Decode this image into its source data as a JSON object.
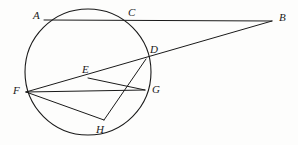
{
  "figure": {
    "kind": "euclidean-circle-diagram",
    "width": 298,
    "height": 145,
    "background_color": "#fdfdfc",
    "stroke_color": "#1a1a1a",
    "label_color": "#1a1a1a"
  },
  "circle": {
    "name": "main-circle",
    "cx": 88,
    "cy": 72,
    "r": 63,
    "stroke_width": 1.1
  },
  "points": [
    {
      "id": "A",
      "label": "A",
      "x": 44,
      "y": 20,
      "label_x": 33,
      "label_y": 10,
      "on_circle": true
    },
    {
      "id": "B",
      "label": "B",
      "x": 272,
      "y": 21,
      "label_x": 279,
      "label_y": 12,
      "on_circle": false
    },
    {
      "id": "C",
      "label": "C",
      "x": 127,
      "y": 20,
      "label_x": 128,
      "label_y": 7,
      "on_circle": true
    },
    {
      "id": "D",
      "label": "D",
      "x": 146,
      "y": 59,
      "label_x": 150,
      "label_y": 44,
      "on_circle": true
    },
    {
      "id": "E",
      "label": "E",
      "x": 88,
      "y": 78,
      "label_x": 82,
      "label_y": 64,
      "on_circle": false
    },
    {
      "id": "F",
      "label": "F",
      "x": 26,
      "y": 92,
      "label_x": 13,
      "label_y": 85,
      "on_circle": true
    },
    {
      "id": "G",
      "label": "G",
      "x": 145,
      "y": 90,
      "label_x": 152,
      "label_y": 84,
      "on_circle": true
    },
    {
      "id": "H",
      "label": "H",
      "x": 104,
      "y": 120,
      "label_x": 96,
      "label_y": 124,
      "on_circle": true
    }
  ],
  "segments": [
    {
      "name": "segment-A-B",
      "from": "A",
      "to": "B",
      "x1": 44,
      "y1": 20,
      "x2": 272,
      "y2": 21
    },
    {
      "name": "segment-F-B",
      "from": "F",
      "to": "B",
      "x1": 26,
      "y1": 92,
      "x2": 272,
      "y2": 21
    },
    {
      "name": "segment-F-G",
      "from": "F",
      "to": "G",
      "x1": 26,
      "y1": 92,
      "x2": 145,
      "y2": 90
    },
    {
      "name": "segment-F-H",
      "from": "F",
      "to": "H",
      "x1": 26,
      "y1": 92,
      "x2": 104,
      "y2": 120
    },
    {
      "name": "segment-E-G",
      "from": "E",
      "to": "G",
      "x1": 88,
      "y1": 78,
      "x2": 145,
      "y2": 90
    },
    {
      "name": "segment-D-H",
      "from": "D",
      "to": "H",
      "x1": 146,
      "y1": 59,
      "x2": 104,
      "y2": 120
    }
  ]
}
